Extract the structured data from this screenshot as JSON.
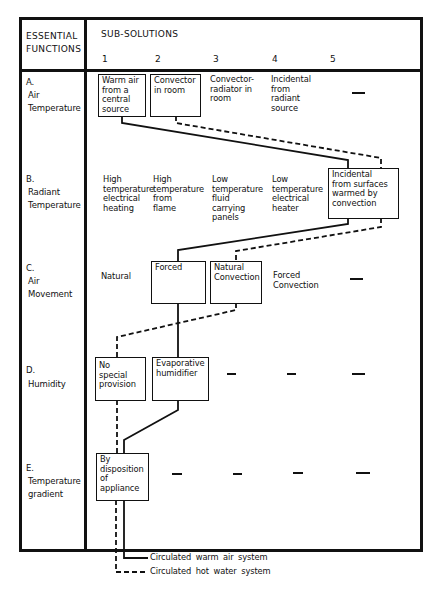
{
  "header": {
    "left_title": "ESSENTIAL\nFUNCTIONS",
    "right_title": "SUB-SOLUTIONS",
    "columns": [
      "1",
      "2",
      "3",
      "4",
      "5"
    ]
  },
  "rows": [
    {
      "letter": "A.",
      "label": "Air\nTemperature",
      "cells": [
        {
          "text": "Warm air\nfrom a\ncentral\nsource",
          "boxed": true
        },
        {
          "text": "Convector\nin room",
          "boxed": true
        },
        {
          "text": "Convector-\nradiator in\nroom",
          "boxed": false
        },
        {
          "text": "Incidental\nfrom\nradiant\nsource",
          "boxed": false
        },
        {
          "text": "—",
          "boxed": false
        }
      ]
    },
    {
      "letter": "B.",
      "label": "Radiant\nTemperature",
      "cells": [
        {
          "text": "High\ntemperature\nelectrical\nheating",
          "boxed": false
        },
        {
          "text": "High\ntemperature\nfrom\nflame",
          "boxed": false
        },
        {
          "text": "Low\ntemperature\nfluid\ncarrying\npanels",
          "boxed": false
        },
        {
          "text": "Low\ntemperature\nelectrical\nheater",
          "boxed": false
        },
        {
          "text": "Incidental\nfrom surfaces\nwarmed by\nconvection",
          "boxed": true
        }
      ]
    },
    {
      "letter": "C.",
      "label": "Air\nMovement",
      "cells": [
        {
          "text": "Natural",
          "boxed": false
        },
        {
          "text": "Forced",
          "boxed": true
        },
        {
          "text": "Natural\nConvection",
          "boxed": true
        },
        {
          "text": "Forced\nConvection",
          "boxed": false
        },
        {
          "text": "—",
          "boxed": false
        }
      ]
    },
    {
      "letter": "D.",
      "label": "Humidity",
      "cells": [
        {
          "text": "No\nspecial\nprovision",
          "boxed": true
        },
        {
          "text": "Evaporative\nhumidifier",
          "boxed": true
        },
        {
          "text": "—",
          "boxed": false
        },
        {
          "text": "—",
          "boxed": false
        },
        {
          "text": "—",
          "boxed": false
        }
      ]
    },
    {
      "letter": "E.",
      "label": "Temperature\ngradient",
      "cells": [
        {
          "text": "By\ndisposition\nof\nappliance",
          "boxed": true
        },
        {
          "text": "—",
          "boxed": false
        },
        {
          "text": "—",
          "boxed": false
        },
        {
          "text": "—",
          "boxed": false
        },
        {
          "text": "—",
          "boxed": false
        }
      ]
    }
  ],
  "legend": [
    {
      "style": "solid",
      "label": "Circulated warm air system"
    },
    {
      "style": "dashed",
      "label": "Circulated hot water system"
    }
  ],
  "paths": {
    "warm_air_solid": [
      "A1",
      "B5",
      "C2",
      "D2",
      "E1"
    ],
    "hot_water_dashed": [
      "A2",
      "B5",
      "C3",
      "D1",
      "E1"
    ]
  },
  "colors": {
    "ink": "#111111",
    "paper": "#ffffff"
  }
}
